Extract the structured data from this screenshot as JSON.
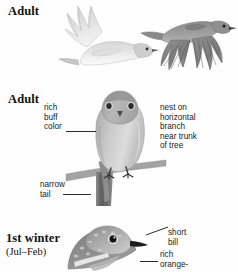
{
  "plate": {
    "title": "Townsend's Solitaire field guide plate",
    "background_color": "#fefefe",
    "ink_color": "#1b1b1b"
  },
  "panels": [
    {
      "id": "adult-flight",
      "heading": "Adult",
      "figures": [
        {
          "name": "adult-in-flight-underside",
          "tone": "#d9d9d9"
        },
        {
          "name": "adult-in-flight-upperside",
          "tone": "#8f8f8f"
        }
      ],
      "callouts": []
    },
    {
      "id": "adult-perched",
      "heading": "Adult",
      "figures": [
        {
          "name": "adult-perched-on-branch",
          "tone": "#bdbdbd"
        }
      ],
      "callouts": [
        {
          "name": "rich-buff-color",
          "text": "rich\nbuff\ncolor",
          "leader": true
        },
        {
          "name": "nest-on-horizontal-branch",
          "text": "nest on\nhorizontal\nbranch\nnear trunk\nof tree",
          "leader": false
        },
        {
          "name": "narrow-tail",
          "text": "narrow\ntail",
          "leader": true
        }
      ]
    },
    {
      "id": "first-winter",
      "heading": "1st winter",
      "subheading": "(Jul–Feb)",
      "figures": [
        {
          "name": "first-winter-head-and-breast",
          "tone": "#9a9a9a"
        }
      ],
      "callouts": [
        {
          "name": "short-bill",
          "text": "short\nbill",
          "leader": true
        },
        {
          "name": "rich-orange",
          "text": "rich\norange-",
          "leader": true
        }
      ]
    }
  ],
  "colors": {
    "ink": "#1b1b1b",
    "leader_line": "#2b2b2b",
    "pale_plumage": "#dcdcdc",
    "mid_plumage": "#b4b4b4",
    "dark_plumage": "#7d7d7d",
    "branch": "#6e6e6e",
    "eye": "#111111",
    "page": "#fefefe"
  }
}
